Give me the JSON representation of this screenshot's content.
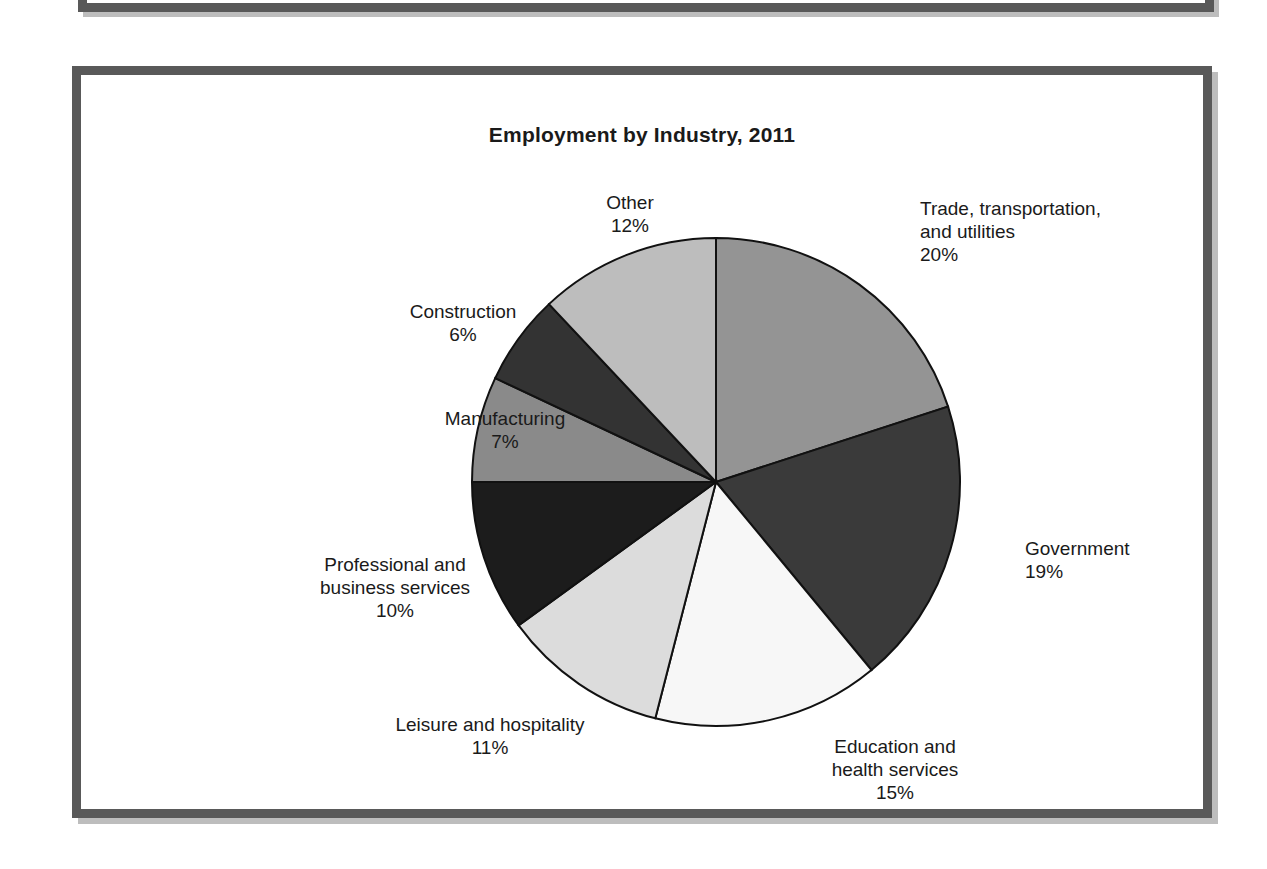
{
  "figure": {
    "title": "Employment by Industry, 2011"
  },
  "chart_data": {
    "type": "pie",
    "title": "Employment by Industry, 2011",
    "xlabel": "",
    "ylabel": "",
    "legend_position": "none",
    "grid": false,
    "start_angle_deg": 0,
    "direction": "clockwise",
    "value_unit": "percent",
    "categories": [
      "Trade, transportation, and utilities",
      "Government",
      "Education and health services",
      "Leisure and hospitality",
      "Professional and business services",
      "Manufacturing",
      "Construction",
      "Other"
    ],
    "values": [
      20,
      19,
      15,
      11,
      10,
      7,
      6,
      12
    ],
    "colors": [
      "#949494",
      "#3a3a3a",
      "#f7f7f7",
      "#dcdcdc",
      "#1c1c1c",
      "#8a8a8a",
      "#333333",
      "#bdbdbd"
    ],
    "slice_border_color": "#111111",
    "slices": [
      {
        "name": "Trade, transportation, and utilities",
        "value": 20,
        "label_text": "Trade, transportation,\nand utilities\n20%",
        "color": "#949494"
      },
      {
        "name": "Government",
        "value": 19,
        "label_text": "Government\n19%",
        "color": "#3a3a3a"
      },
      {
        "name": "Education and health services",
        "value": 15,
        "label_text": "Education and\nhealth services\n15%",
        "color": "#f7f7f7"
      },
      {
        "name": "Leisure and hospitality",
        "value": 11,
        "label_text": "Leisure and hospitality\n11%",
        "color": "#dcdcdc"
      },
      {
        "name": "Professional and business services",
        "value": 10,
        "label_text": "Professional and\nbusiness services\n10%",
        "color": "#1c1c1c"
      },
      {
        "name": "Manufacturing",
        "value": 7,
        "label_text": "Manufacturing\n7%",
        "color": "#8a8a8a"
      },
      {
        "name": "Construction",
        "value": 6,
        "label_text": "Construction\n6%",
        "color": "#333333"
      },
      {
        "name": "Other",
        "value": 12,
        "label_text": "Other\n12%",
        "color": "#bdbdbd"
      }
    ]
  },
  "labels": {
    "trade": "Trade, transportation,\nand utilities\n20%",
    "government": "Government\n19%",
    "education": "Education and\nhealth services\n15%",
    "leisure": "Leisure and hospitality\n11%",
    "professional": "Professional and\nbusiness services\n10%",
    "manufacturing": "Manufacturing\n7%",
    "construction": "Construction\n6%",
    "other": "Other\n12%"
  }
}
